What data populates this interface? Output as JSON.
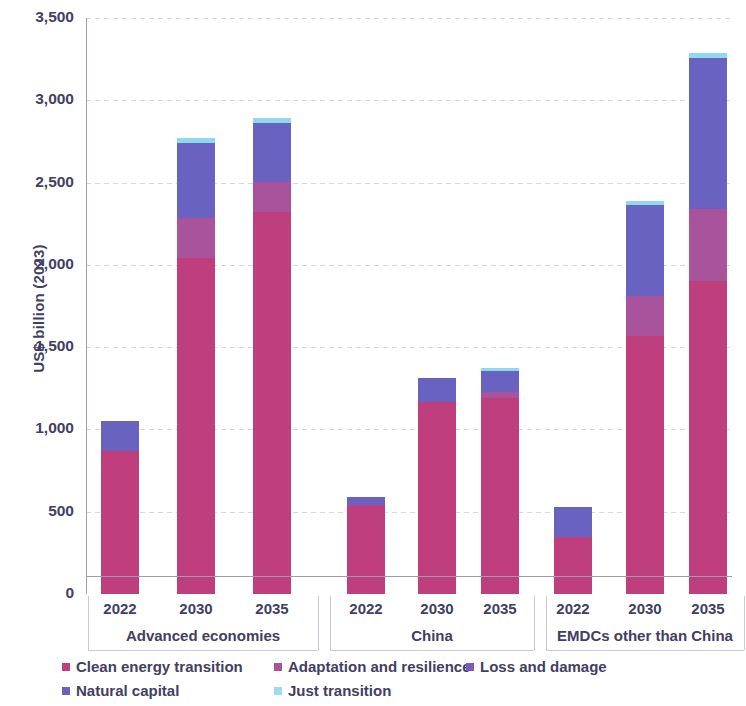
{
  "chart_data": {
    "type": "bar",
    "title": "",
    "subtitle": "",
    "xlabel": "",
    "ylabel": "US$ billion (2023)",
    "ylim": [
      0,
      3500
    ],
    "ytick_values": [
      0,
      500,
      1000,
      1500,
      2000,
      2500,
      3000,
      3500
    ],
    "ytick_labels": [
      "0",
      "500",
      "1,000",
      "1,500",
      "2,000",
      "2,500",
      "3,000",
      "3,500"
    ],
    "grid": true,
    "stacked": true,
    "legend_position": "bottom",
    "groups": [
      {
        "label": "Advanced economies",
        "categories": [
          "2022",
          "2030",
          "2035"
        ]
      },
      {
        "label": "China",
        "categories": [
          "2022",
          "2030",
          "2035"
        ]
      },
      {
        "label": "EMDCs other than China",
        "categories": [
          "2022",
          "2030",
          "2035"
        ]
      }
    ],
    "categories": [
      "Advanced economies 2022",
      "Advanced economies 2030",
      "Advanced economies 2035",
      "China 2022",
      "China 2030",
      "China 2035",
      "EMDCs other than China 2022",
      "EMDCs other than China 2030",
      "EMDCs other than China 2035"
    ],
    "series": [
      {
        "name": "Clean energy transition",
        "color": "#bf3f7e",
        "values": [
          870,
          2040,
          2320,
          540,
          1165,
          1190,
          345,
          1570,
          1900
        ]
      },
      {
        "name": "Adaptation and resilience",
        "color": "#a8539b",
        "values": [
          0,
          245,
          185,
          0,
          0,
          40,
          0,
          240,
          440
        ]
      },
      {
        "name": "Loss and damage",
        "color": "#8b5bb0",
        "values": [
          0,
          0,
          0,
          0,
          0,
          0,
          0,
          0,
          0
        ]
      },
      {
        "name": "Natural capital",
        "color": "#6a62c0",
        "values": [
          180,
          455,
          360,
          50,
          145,
          125,
          185,
          555,
          915
        ]
      },
      {
        "name": "Just transition",
        "color": "#8fd8ef",
        "values": [
          0,
          30,
          25,
          0,
          0,
          20,
          0,
          25,
          35
        ]
      }
    ],
    "totals": [
      1050,
      2770,
      2890,
      590,
      1310,
      1375,
      530,
      2390,
      3290
    ]
  },
  "legend": {
    "items": [
      {
        "label": "Clean energy transition",
        "color": "#bf3f7e"
      },
      {
        "label": "Adaptation and resilience",
        "color": "#a8539b"
      },
      {
        "label": "Loss and damage",
        "color": "#7b5cb8"
      },
      {
        "label": "Natural capital",
        "color": "#6a62c0"
      },
      {
        "label": "Just transition",
        "color": "#9cdcf0"
      }
    ]
  },
  "colors": {
    "axis": "#3f4062",
    "grid": "#cfd0de",
    "background": "#ffffff"
  }
}
